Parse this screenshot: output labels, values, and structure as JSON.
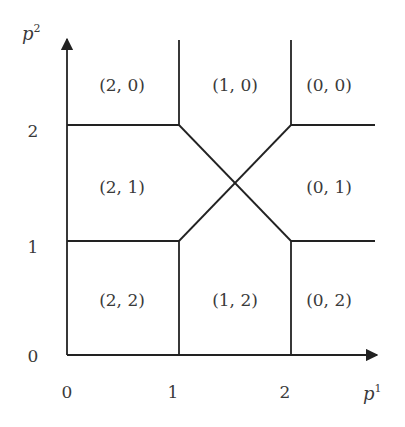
{
  "diagram": {
    "type": "partition-diagram",
    "axes": {
      "x": {
        "label": "p",
        "superscript": "1",
        "ticks": [
          "0",
          "1",
          "2"
        ]
      },
      "y": {
        "label": "p",
        "superscript": "2",
        "ticks": [
          "0",
          "1",
          "2"
        ]
      }
    },
    "regions": [
      {
        "id": "r20",
        "label": "(2, 0)"
      },
      {
        "id": "r10",
        "label": "(1, 0)"
      },
      {
        "id": "r00",
        "label": "(0, 0)"
      },
      {
        "id": "r21",
        "label": "(2, 1)"
      },
      {
        "id": "r01",
        "label": "(0, 1)"
      },
      {
        "id": "r22",
        "label": "(2, 2)"
      },
      {
        "id": "r12",
        "label": "(1, 2)"
      },
      {
        "id": "r02",
        "label": "(0, 2)"
      }
    ],
    "colors": {
      "line": "#222222",
      "text": "#3a3a3a",
      "background": "#ffffff"
    }
  }
}
